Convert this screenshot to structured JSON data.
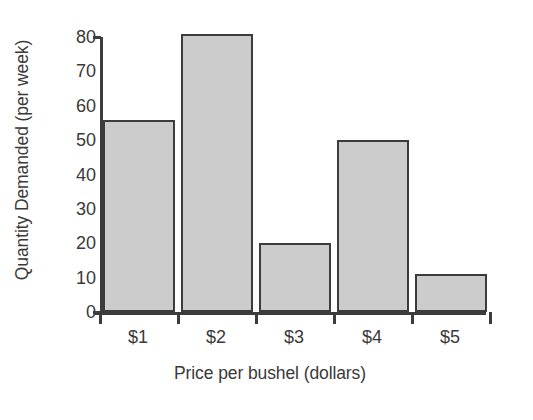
{
  "chart_data": {
    "type": "bar",
    "title": "",
    "subtitle": "",
    "categories": [
      "$1",
      "$2",
      "$3",
      "$4",
      "$5"
    ],
    "values": [
      56,
      81,
      20,
      50,
      11
    ],
    "xlabel": "Price per bushel (dollars)",
    "ylabel": "Quantity Demanded (per week)",
    "ylim": [
      0,
      80
    ],
    "yticks": [
      0,
      10,
      20,
      30,
      40,
      50,
      60,
      70,
      80
    ],
    "ytick_labels": [
      "0",
      "10",
      "20",
      "30",
      "40",
      "50",
      "60",
      "70",
      "80"
    ],
    "grid": false,
    "legend": false,
    "legend_position": "none",
    "bar_fill_color": "#cccccc",
    "bar_edge_color": "#3c3c3c",
    "axis_color": "#3c3c3c",
    "text_color": "#3a3a3a",
    "background_color": "#ffffff"
  }
}
